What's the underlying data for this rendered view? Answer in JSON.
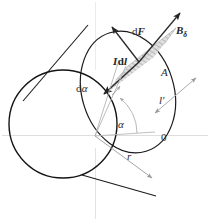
{
  "figure": {
    "labels": {
      "force_vector": "dF",
      "flux_density": "B",
      "flux_density_sub": "δ",
      "current_element_I": "I",
      "current_element_dl": "dl",
      "area_label": "A",
      "length_label": "l'",
      "zero_label": "0",
      "angle_increment": "dα",
      "angle": "α",
      "radius": "r"
    },
    "colors": {
      "outline": "#1a1a1a",
      "arrow_dark": "#262626",
      "dimension_gray": "#9a9a9a",
      "axis_gray": "#d8d8d8",
      "hatch_gray": "#8f8f8f",
      "band_fill": "#dcdcdc",
      "background": "#ffffff"
    },
    "geometry": {
      "front_circle_center_x": 63,
      "front_circle_center_y": 124,
      "front_circle_radius": 54,
      "back_ellipse_center_x": 128,
      "back_ellipse_center_y": 92,
      "back_ellipse_rx": 47,
      "back_ellipse_ry": 62,
      "origin_x": 95,
      "origin_y": 136
    }
  }
}
